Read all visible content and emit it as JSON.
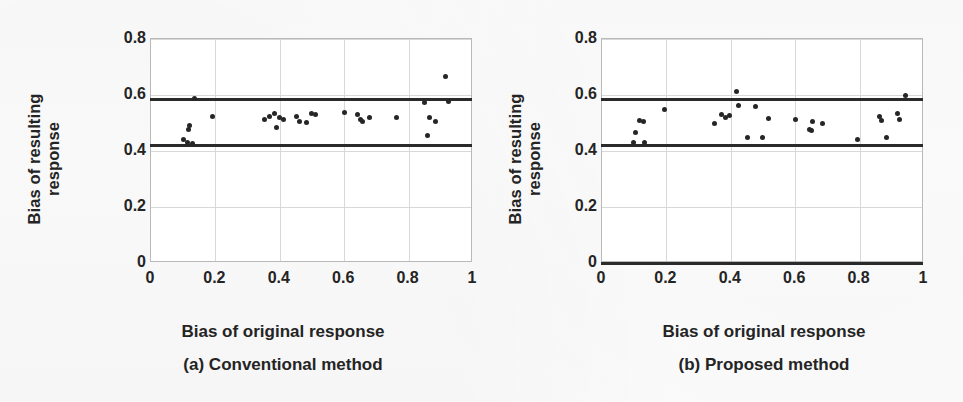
{
  "figure": {
    "kind": "two-panel-scatter-figure",
    "background_color": "#ffffff",
    "point_color": "#262626",
    "limit_line_color": "#2a2a2a",
    "grid_color": "#d8d8d8"
  },
  "panels": [
    {
      "id": "a",
      "caption": "(a) Conventional method",
      "xlabel": "Bias of original response",
      "ylabel": "Bias of resulting\nresponse"
    },
    {
      "id": "b",
      "caption": "(b) Proposed method",
      "xlabel": "Bias of original response",
      "ylabel": "Bias of resulting\nresponse"
    }
  ],
  "axes": {
    "xticks": [
      "0",
      "0.2",
      "0.4",
      "0.6",
      "0.8",
      "1"
    ],
    "xtick_values": [
      0,
      0.2,
      0.4,
      0.6,
      0.8,
      1
    ],
    "yticks": [
      "0",
      "0.2",
      "0.4",
      "0.6",
      "0.8"
    ],
    "ytick_values": [
      0,
      0.2,
      0.4,
      0.6,
      0.8
    ],
    "xlim": [
      0,
      1
    ],
    "ylim": [
      0,
      0.8
    ],
    "grid": true
  },
  "chart_data": [
    {
      "type": "scatter",
      "panel": "a",
      "title": "(a) Conventional method",
      "xlabel": "Bias of original response",
      "ylabel": "Bias of resulting response",
      "xlim": [
        0,
        1
      ],
      "ylim": [
        0,
        0.8
      ],
      "xticks": [
        0,
        0.2,
        0.4,
        0.6,
        0.8,
        1
      ],
      "yticks": [
        0,
        0.2,
        0.4,
        0.6,
        0.8
      ],
      "grid": true,
      "legend": null,
      "reference_lines": [
        {
          "name": "upper-limit",
          "orientation": "horizontal",
          "y": 0.583
        },
        {
          "name": "lower-limit",
          "orientation": "horizontal",
          "y": 0.418
        }
      ],
      "points": [
        {
          "x": 0.1,
          "y": 0.442
        },
        {
          "x": 0.112,
          "y": 0.432
        },
        {
          "x": 0.118,
          "y": 0.478
        },
        {
          "x": 0.12,
          "y": 0.49
        },
        {
          "x": 0.128,
          "y": 0.427
        },
        {
          "x": 0.135,
          "y": 0.588
        },
        {
          "x": 0.19,
          "y": 0.524
        },
        {
          "x": 0.352,
          "y": 0.513
        },
        {
          "x": 0.368,
          "y": 0.525
        },
        {
          "x": 0.383,
          "y": 0.535
        },
        {
          "x": 0.39,
          "y": 0.485
        },
        {
          "x": 0.4,
          "y": 0.518
        },
        {
          "x": 0.412,
          "y": 0.513
        },
        {
          "x": 0.452,
          "y": 0.524
        },
        {
          "x": 0.46,
          "y": 0.505
        },
        {
          "x": 0.482,
          "y": 0.501
        },
        {
          "x": 0.498,
          "y": 0.533
        },
        {
          "x": 0.51,
          "y": 0.529
        },
        {
          "x": 0.6,
          "y": 0.537
        },
        {
          "x": 0.642,
          "y": 0.53
        },
        {
          "x": 0.65,
          "y": 0.512
        },
        {
          "x": 0.658,
          "y": 0.504
        },
        {
          "x": 0.678,
          "y": 0.518
        },
        {
          "x": 0.762,
          "y": 0.521
        },
        {
          "x": 0.85,
          "y": 0.575
        },
        {
          "x": 0.858,
          "y": 0.455
        },
        {
          "x": 0.865,
          "y": 0.521
        },
        {
          "x": 0.882,
          "y": 0.505
        },
        {
          "x": 0.915,
          "y": 0.665
        },
        {
          "x": 0.925,
          "y": 0.578
        }
      ]
    },
    {
      "type": "scatter",
      "panel": "b",
      "title": "(b) Proposed method",
      "xlabel": "Bias of original response",
      "ylabel": "Bias of resulting response",
      "xlim": [
        0,
        1
      ],
      "ylim": [
        0,
        0.8
      ],
      "xticks": [
        0,
        0.2,
        0.4,
        0.6,
        0.8,
        1
      ],
      "yticks": [
        0,
        0.2,
        0.4,
        0.6,
        0.8
      ],
      "grid": true,
      "legend": null,
      "reference_lines": [
        {
          "name": "upper-limit",
          "orientation": "horizontal",
          "y": 0.583
        },
        {
          "name": "lower-limit",
          "orientation": "horizontal",
          "y": 0.418
        },
        {
          "name": "baseline",
          "orientation": "horizontal",
          "y": 0.0
        }
      ],
      "points": [
        {
          "x": 0.098,
          "y": 0.43
        },
        {
          "x": 0.105,
          "y": 0.466
        },
        {
          "x": 0.118,
          "y": 0.51
        },
        {
          "x": 0.128,
          "y": 0.505
        },
        {
          "x": 0.133,
          "y": 0.432
        },
        {
          "x": 0.195,
          "y": 0.548
        },
        {
          "x": 0.348,
          "y": 0.498
        },
        {
          "x": 0.372,
          "y": 0.532
        },
        {
          "x": 0.382,
          "y": 0.518
        },
        {
          "x": 0.395,
          "y": 0.527
        },
        {
          "x": 0.418,
          "y": 0.612
        },
        {
          "x": 0.425,
          "y": 0.562
        },
        {
          "x": 0.452,
          "y": 0.448
        },
        {
          "x": 0.478,
          "y": 0.558
        },
        {
          "x": 0.498,
          "y": 0.447
        },
        {
          "x": 0.518,
          "y": 0.515
        },
        {
          "x": 0.6,
          "y": 0.512
        },
        {
          "x": 0.645,
          "y": 0.478
        },
        {
          "x": 0.652,
          "y": 0.472
        },
        {
          "x": 0.655,
          "y": 0.505
        },
        {
          "x": 0.685,
          "y": 0.498
        },
        {
          "x": 0.795,
          "y": 0.44
        },
        {
          "x": 0.862,
          "y": 0.525
        },
        {
          "x": 0.868,
          "y": 0.508
        },
        {
          "x": 0.882,
          "y": 0.447
        },
        {
          "x": 0.918,
          "y": 0.535
        },
        {
          "x": 0.925,
          "y": 0.512
        },
        {
          "x": 0.942,
          "y": 0.598
        }
      ]
    }
  ]
}
